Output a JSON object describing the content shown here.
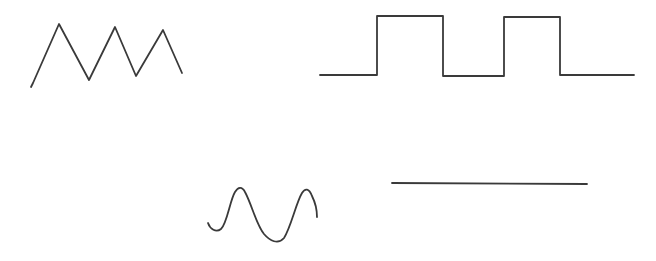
{
  "canvas": {
    "width": 656,
    "height": 261,
    "background": "#ffffff"
  },
  "stroke": {
    "color": "#3a3a3a",
    "width": 1.8
  },
  "waveforms": [
    {
      "id": "triangle-wave",
      "type": "triangle",
      "points": [
        [
          31,
          87
        ],
        [
          33,
          83
        ],
        [
          59,
          24
        ],
        [
          89,
          80
        ],
        [
          115,
          27
        ],
        [
          136,
          76
        ],
        [
          163,
          30
        ],
        [
          182,
          73
        ]
      ]
    },
    {
      "id": "square-wave",
      "type": "square",
      "points": [
        [
          320,
          75
        ],
        [
          377,
          75
        ],
        [
          377,
          16
        ],
        [
          443,
          16
        ],
        [
          443,
          76
        ],
        [
          504,
          76
        ],
        [
          504,
          17
        ],
        [
          560,
          17
        ],
        [
          560,
          75
        ],
        [
          634,
          75
        ]
      ]
    },
    {
      "id": "sine-wave",
      "type": "sine",
      "path": "M208,223 C210,229 216,233 221,229 C227,224 230,200 235,192 C238,187 242,186 245,192 C252,205 256,224 264,234 C270,241 278,245 284,238 C291,227 296,203 302,193 C305,188 309,188 312,196 C316,204 317,210 317,217"
    },
    {
      "id": "flat-line",
      "type": "constant",
      "points": [
        [
          392,
          183
        ],
        [
          587,
          184
        ]
      ]
    }
  ]
}
